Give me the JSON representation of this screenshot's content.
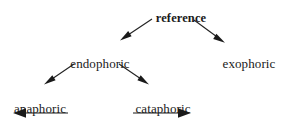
{
  "diagram": {
    "type": "tree",
    "nodes": [
      {
        "id": "reference",
        "label": "reference",
        "level": 0,
        "bold": true,
        "x": 181,
        "y": 11
      },
      {
        "id": "endophoric",
        "label": "endophoric",
        "level": 1,
        "bold": false,
        "x": 100,
        "y": 56
      },
      {
        "id": "exophoric",
        "label": "exophoric",
        "level": 1,
        "bold": false,
        "x": 249,
        "y": 56
      },
      {
        "id": "anaphoric",
        "label": "anaphoric",
        "level": 2,
        "bold": false,
        "x": 40,
        "y": 101
      },
      {
        "id": "cataphoric",
        "label": "cataphoric",
        "level": 2,
        "bold": false,
        "x": 163,
        "y": 101
      }
    ],
    "edges": [
      {
        "from": "reference",
        "to": "endophoric",
        "direction": "down-left"
      },
      {
        "from": "reference",
        "to": "exophoric",
        "direction": "down-right"
      },
      {
        "from": "endophoric",
        "to": "anaphoric",
        "direction": "down-left"
      },
      {
        "from": "endophoric",
        "to": "cataphoric",
        "direction": "down-right"
      }
    ],
    "relation_arrows": [
      {
        "under": "anaphoric",
        "direction": "left",
        "x1": 68,
        "x2": 14,
        "y": 113
      },
      {
        "under": "cataphoric",
        "direction": "right",
        "x1": 133,
        "x2": 191,
        "y": 113
      }
    ],
    "colors": {
      "background": "#ffffff",
      "text": "#1a1a1a",
      "stroke": "#222222"
    }
  }
}
